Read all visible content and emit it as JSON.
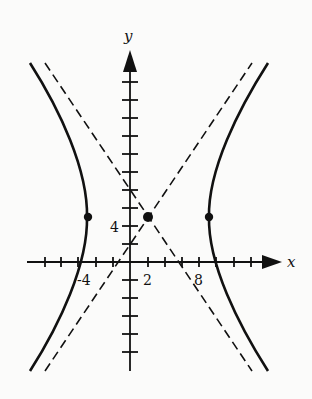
{
  "figure": {
    "axes": {
      "x_label": "x",
      "y_label": "y"
    },
    "tick_labels": {
      "x": [
        "-4",
        "2",
        "8"
      ],
      "y": [
        "4"
      ]
    },
    "units_per_tick": 2,
    "center": [
      2,
      4
    ],
    "vertices": [
      [
        -5,
        4
      ],
      [
        9,
        4
      ]
    ],
    "asymptotes": [
      "y - 4 = (4/3)(x - 2)",
      "y - 4 = -(4/3)(x - 2)"
    ],
    "colors": {
      "ink": "#111111",
      "background": "#fbfbfa"
    }
  }
}
